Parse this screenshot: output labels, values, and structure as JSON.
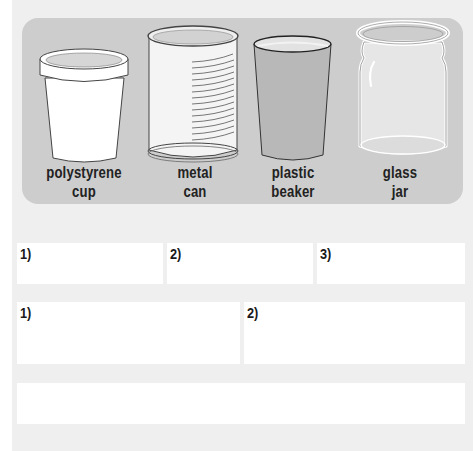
{
  "containers": [
    {
      "id": "polystyrene-cup",
      "line1": "polystyrene",
      "line2": "cup",
      "icon": "polystyrene-cup-icon"
    },
    {
      "id": "metal-can",
      "line1": "metal",
      "line2": "can",
      "icon": "metal-can-icon"
    },
    {
      "id": "plastic-beaker",
      "line1": "plastic",
      "line2": "beaker",
      "icon": "plastic-beaker-icon"
    },
    {
      "id": "glass-jar",
      "line1": "glass",
      "line2": "jar",
      "icon": "glass-jar-icon"
    }
  ],
  "answer_rows": [
    {
      "boxes": [
        {
          "label": "1)"
        },
        {
          "label": "2)"
        },
        {
          "label": "3)"
        }
      ]
    },
    {
      "boxes": [
        {
          "label": "1)"
        },
        {
          "label": "2)"
        }
      ]
    },
    {
      "boxes": [
        {
          "label": ""
        }
      ]
    }
  ],
  "colors": {
    "panel": "#cdcdcd",
    "backdrop": "#efefef",
    "beaker_fill": "#b8b8b8",
    "text": "#222222"
  }
}
